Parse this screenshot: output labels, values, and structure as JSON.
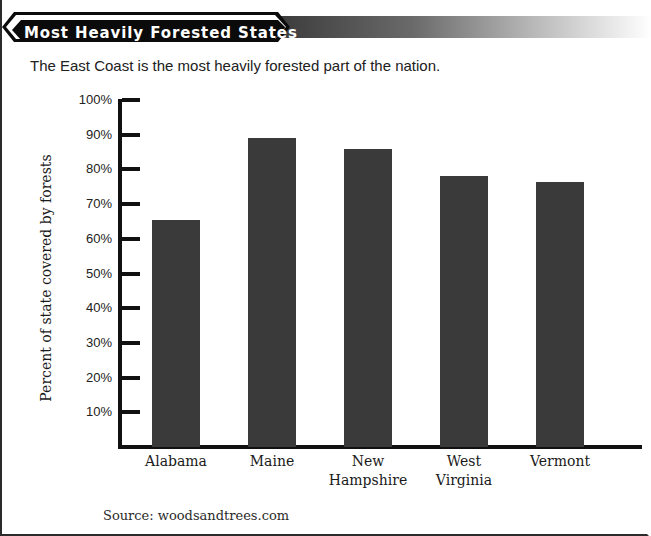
{
  "banner": {
    "title": "Most Heavily Forested States"
  },
  "subtitle": "The East Coast is the most heavily forested part of the nation.",
  "source": "Source: woodsandtrees.com",
  "chart_data": {
    "type": "bar",
    "title": "Most Heavily Forested States",
    "subtitle": "The East Coast is the most heavily forested part of the nation.",
    "categories": [
      "Alabama",
      "Maine",
      "New Hampshire",
      "West Virginia",
      "Vermont"
    ],
    "category_lines": [
      [
        "Alabama"
      ],
      [
        "Maine"
      ],
      [
        "New",
        "Hampshire"
      ],
      [
        "West",
        "Virginia"
      ],
      [
        "Vermont"
      ]
    ],
    "values": [
      65.5,
      89,
      86,
      78,
      76.5
    ],
    "xlabel": "",
    "ylabel": "Percent of state covered by forests",
    "ylim": [
      0,
      100
    ],
    "ytick_labels": [
      "100%",
      "90%",
      "80%",
      "70%",
      "60%",
      "50%",
      "40%",
      "30%",
      "20%",
      "10%"
    ],
    "ytick_values": [
      100,
      90,
      80,
      70,
      60,
      50,
      40,
      30,
      20,
      10
    ],
    "grid": false,
    "legend": false,
    "bar_color": "#3a3a3a",
    "axis_color": "#111111",
    "source": "Source: woodsandtrees.com"
  }
}
